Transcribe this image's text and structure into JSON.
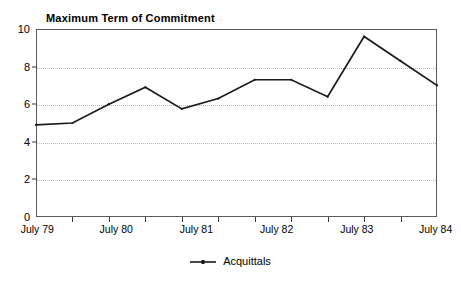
{
  "chart_data": {
    "type": "line",
    "title": "Maximum Term of Commitment",
    "xlabel": "",
    "ylabel": "",
    "ylim": [
      0,
      10
    ],
    "ytick_values": [
      0,
      2,
      4,
      6,
      8,
      10
    ],
    "ytick_labels": [
      "0",
      "2",
      "4",
      "6",
      "8",
      "10"
    ],
    "grid": "horizontal-dotted",
    "legend_position": "bottom-center",
    "x_axis_labels": [
      "July 79",
      "July 80",
      "July 81",
      "July 82",
      "July 83",
      "July 84"
    ],
    "x_label_positions": [
      0,
      2.2,
      4.4,
      6.6,
      8.8,
      11
    ],
    "x_index_range": [
      0,
      11
    ],
    "x_tick_count": 12,
    "series": [
      {
        "name": "Acquittals",
        "color": "#1a1a1a",
        "x": [
          0,
          1,
          2,
          3,
          4,
          5,
          6,
          7,
          8,
          9,
          10,
          11
        ],
        "values": [
          4.9,
          5.0,
          6.0,
          6.9,
          5.75,
          6.3,
          7.3,
          7.3,
          6.4,
          9.6,
          8.3,
          7.0
        ]
      }
    ]
  },
  "legend": {
    "entries": [
      {
        "label": "Acquittals",
        "marker": "line-with-point"
      }
    ]
  }
}
